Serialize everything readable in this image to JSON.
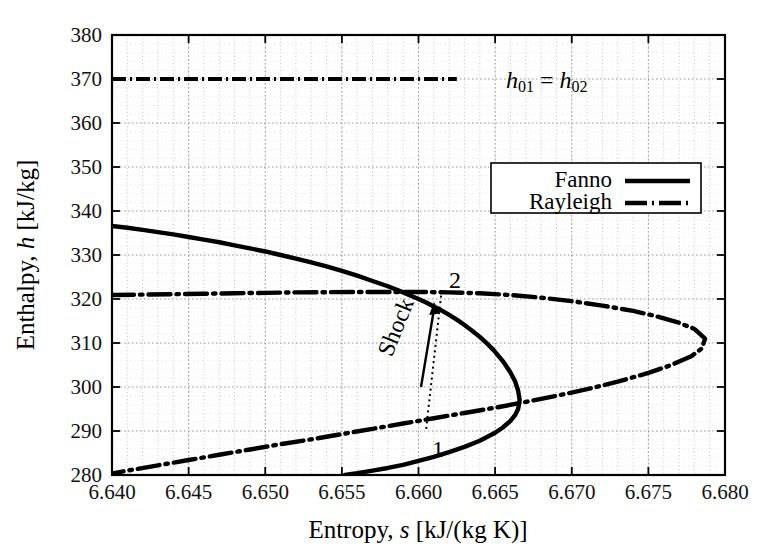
{
  "chart_data": {
    "type": "line",
    "title": "",
    "xlabel": "Entropy, s [kJ/(kg K)]",
    "ylabel": "Enthalpy, h [kJ/kg]",
    "xlim": [
      6.64,
      6.68
    ],
    "ylim": [
      280,
      380
    ],
    "xticks": [
      "6.640",
      "6.645",
      "6.650",
      "6.655",
      "6.660",
      "6.665",
      "6.670",
      "6.675",
      "6.680"
    ],
    "xtick_values": [
      6.64,
      6.645,
      6.65,
      6.655,
      6.66,
      6.665,
      6.67,
      6.675,
      6.68
    ],
    "yticks": [
      "280",
      "290",
      "300",
      "310",
      "320",
      "330",
      "340",
      "350",
      "360",
      "370",
      "380"
    ],
    "ytick_values": [
      280,
      290,
      300,
      310,
      320,
      330,
      340,
      350,
      360,
      370,
      380
    ],
    "x_minor_step": 0.001,
    "y_minor_step": 2,
    "grid": true,
    "grid_style": "dotted",
    "legend_position": "upper-right-inside",
    "series": [
      {
        "name": "Fanno",
        "style": "solid",
        "color": "#000000",
        "points": [
          [
            6.64,
            336.6
          ],
          [
            6.641,
            336.2
          ],
          [
            6.642,
            335.7
          ],
          [
            6.643,
            335.2
          ],
          [
            6.644,
            334.7
          ],
          [
            6.645,
            334.1
          ],
          [
            6.646,
            333.5
          ],
          [
            6.647,
            332.9
          ],
          [
            6.648,
            332.2
          ],
          [
            6.649,
            331.5
          ],
          [
            6.65,
            330.8
          ],
          [
            6.651,
            330.0
          ],
          [
            6.652,
            329.2
          ],
          [
            6.653,
            328.3
          ],
          [
            6.654,
            327.4
          ],
          [
            6.655,
            326.4
          ],
          [
            6.656,
            325.3
          ],
          [
            6.657,
            324.1
          ],
          [
            6.658,
            322.9
          ],
          [
            6.659,
            321.5
          ],
          [
            6.66,
            320.0
          ],
          [
            6.6605,
            319.2
          ],
          [
            6.661,
            318.3
          ],
          [
            6.6615,
            317.4
          ],
          [
            6.662,
            316.4
          ],
          [
            6.6625,
            315.3
          ],
          [
            6.663,
            314.1
          ],
          [
            6.6635,
            312.8
          ],
          [
            6.664,
            311.4
          ],
          [
            6.6645,
            309.8
          ],
          [
            6.665,
            308.0
          ],
          [
            6.6655,
            305.9
          ],
          [
            6.666,
            303.3
          ],
          [
            6.6663,
            301.3
          ],
          [
            6.6665,
            299.2
          ],
          [
            6.6666,
            297.0
          ],
          [
            6.6665,
            295.0
          ],
          [
            6.6663,
            293.6
          ],
          [
            6.666,
            292.3
          ],
          [
            6.6655,
            290.8
          ],
          [
            6.665,
            289.6
          ],
          [
            6.664,
            287.8
          ],
          [
            6.663,
            286.4
          ],
          [
            6.662,
            285.2
          ],
          [
            6.661,
            284.1
          ],
          [
            6.66,
            283.2
          ],
          [
            6.659,
            282.3
          ],
          [
            6.658,
            281.6
          ],
          [
            6.657,
            281.0
          ],
          [
            6.656,
            280.4
          ],
          [
            6.6552,
            280.0
          ]
        ]
      },
      {
        "name": "Rayleigh",
        "style": "dashdot",
        "color": "#000000",
        "points": [
          [
            6.64,
            320.9
          ],
          [
            6.642,
            321.0
          ],
          [
            6.644,
            321.1
          ],
          [
            6.646,
            321.2
          ],
          [
            6.648,
            321.3
          ],
          [
            6.65,
            321.4
          ],
          [
            6.652,
            321.5
          ],
          [
            6.654,
            321.55
          ],
          [
            6.656,
            321.6
          ],
          [
            6.658,
            321.6
          ],
          [
            6.66,
            321.6
          ],
          [
            6.662,
            321.5
          ],
          [
            6.664,
            321.3
          ],
          [
            6.666,
            320.9
          ],
          [
            6.668,
            320.3
          ],
          [
            6.67,
            319.5
          ],
          [
            6.672,
            318.5
          ],
          [
            6.674,
            317.3
          ],
          [
            6.6755,
            316.1
          ],
          [
            6.677,
            314.6
          ],
          [
            6.678,
            313.2
          ],
          [
            6.6787,
            311.0
          ],
          [
            6.6785,
            308.8
          ],
          [
            6.6778,
            307.0
          ],
          [
            6.6765,
            305.0
          ],
          [
            6.675,
            303.2
          ],
          [
            6.673,
            301.2
          ],
          [
            6.671,
            299.5
          ],
          [
            6.669,
            298.0
          ],
          [
            6.667,
            296.6
          ],
          [
            6.665,
            295.3
          ],
          [
            6.663,
            294.1
          ],
          [
            6.661,
            292.9
          ],
          [
            6.659,
            291.7
          ],
          [
            6.657,
            290.5
          ],
          [
            6.655,
            289.3
          ],
          [
            6.653,
            288.1
          ],
          [
            6.651,
            287.0
          ],
          [
            6.649,
            285.8
          ],
          [
            6.647,
            284.6
          ],
          [
            6.645,
            283.4
          ],
          [
            6.643,
            282.2
          ],
          [
            6.641,
            281.0
          ],
          [
            6.6395,
            280.0
          ]
        ]
      }
    ],
    "reference_lines": [
      {
        "name": "stagnation-enthalpy",
        "label": "h01 = h02",
        "orientation": "horizontal",
        "value": 370,
        "style": "dashdot",
        "x_end": 6.6625
      }
    ],
    "annotations": [
      {
        "name": "point-1",
        "label": "1",
        "x": 6.6605,
        "y": 290.5,
        "label_dx": 4,
        "label_dy": 22
      },
      {
        "name": "point-2",
        "label": "2",
        "x": 6.6615,
        "y": 321.6,
        "label_dx": 8,
        "label_dy": -10
      },
      {
        "name": "shock-label",
        "label": "Shock",
        "x": 6.6585,
        "y": 307,
        "rotation": -68
      },
      {
        "name": "shock-arrow",
        "label": "",
        "x1": 6.6592,
        "y1": 297.5,
        "x2": 6.6601,
        "y2": 315.5
      }
    ],
    "shock_path": {
      "name": "shock-transition-line",
      "style": "dotted",
      "from": [
        6.6605,
        290.5
      ],
      "to": [
        6.6615,
        321.6
      ]
    }
  },
  "legend": {
    "entries": [
      {
        "label": "Fanno",
        "style": "solid"
      },
      {
        "label": "Rayleigh",
        "style": "dashdot"
      }
    ]
  },
  "annotation_text": {
    "stagnation": "h01 = h02",
    "stagnation_base_1": "h",
    "stagnation_sub_1": "01",
    "stagnation_eq": " = ",
    "stagnation_base_2": "h",
    "stagnation_sub_2": "02",
    "shock": "Shock",
    "point_one": "1",
    "point_two": "2"
  },
  "axes": {
    "x_title_plain_1": "Entropy, ",
    "x_title_italic": "s",
    "x_title_plain_2": " [kJ/(kg K)]",
    "y_title_plain_1": "Enthalpy, ",
    "y_title_italic": "h",
    "y_title_plain_2": " [kJ/kg]"
  },
  "colors": {
    "curve": "#000000",
    "grid": "#b8b8b8",
    "axis": "#000000",
    "background": "#ffffff"
  }
}
